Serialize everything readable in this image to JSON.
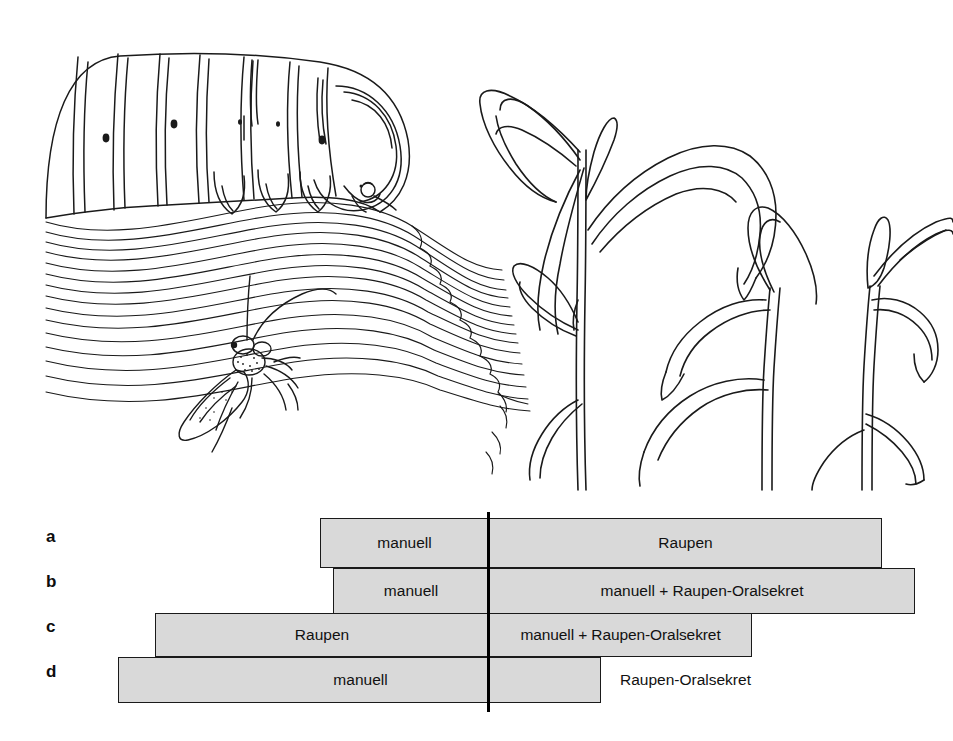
{
  "figure": {
    "background_color": "#ffffff",
    "illustration": {
      "name": "line-drawing-caterpillar-wasp-maize",
      "style": "black ink line drawing",
      "left_scene": "caterpillar feeding on a leaf with a parasitoid wasp beneath",
      "right_scene": "two maize plants with drooping leaves",
      "line_color": "#1a1a1a"
    },
    "timeline": {
      "divider": {
        "name": "treatment-divider-line",
        "color": "#000000",
        "x": 487,
        "top": 512,
        "bottom": 712
      },
      "bar_fill": "#d9d9d9",
      "bar_border": "#1a1a1a",
      "rows": [
        {
          "label": "a",
          "label_x": 46,
          "label_y": 535,
          "bar": {
            "x": 320,
            "y": 518,
            "width": 562,
            "height": 50
          },
          "segments": [
            {
              "text": "manuell",
              "x": 0,
              "width": 167
            },
            {
              "text": "Raupen",
              "x": 167,
              "width": 395
            }
          ],
          "outside": null
        },
        {
          "label": "b",
          "label_x": 46,
          "label_y": 580,
          "bar": {
            "x": 333,
            "y": 568,
            "width": 582,
            "height": 46
          },
          "segments": [
            {
              "text": "manuell",
              "x": 0,
              "width": 154
            },
            {
              "text": "manuell + Raupen-Oralsekret",
              "x": 154,
              "width": 428
            }
          ],
          "outside": null
        },
        {
          "label": "c",
          "label_x": 46,
          "label_y": 625,
          "bar": {
            "x": 155,
            "y": 613,
            "width": 597,
            "height": 44
          },
          "segments": [
            {
              "text": "Raupen",
              "x": 0,
              "width": 332
            },
            {
              "text": "manuell + Raupen-Oralsekret",
              "x": 332,
              "width": 265
            }
          ],
          "outside": null
        },
        {
          "label": "d",
          "label_x": 46,
          "label_y": 670,
          "bar": {
            "x": 118,
            "y": 657,
            "width": 483,
            "height": 46
          },
          "segments": [
            {
              "text": "manuell",
              "x": 0,
              "width": 483
            }
          ],
          "outside": {
            "text": "Raupen-Oralsekret",
            "x": 620,
            "y": 657,
            "height": 46
          }
        }
      ]
    }
  }
}
